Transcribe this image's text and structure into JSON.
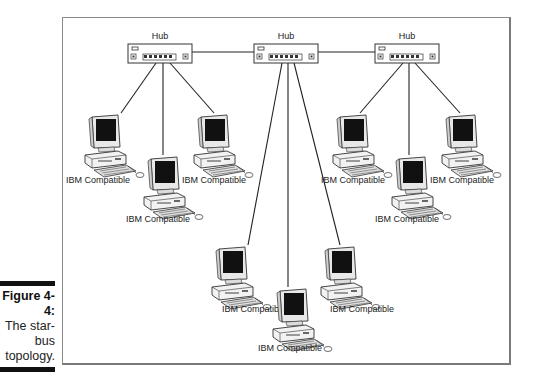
{
  "figure": {
    "number": "Figure 4-4:",
    "caption_lines": [
      "The star-",
      "bus",
      "topology."
    ]
  },
  "hubs": [
    {
      "label": "Hub"
    },
    {
      "label": "Hub"
    },
    {
      "label": "Hub"
    }
  ],
  "computers": [
    {
      "label": "IBM Compatible"
    },
    {
      "label": "IBM Compatible"
    },
    {
      "label": "IBM Compatible"
    },
    {
      "label": "IBM Compatible"
    },
    {
      "label": "IBM Compatible"
    },
    {
      "label": "IBM Compatible"
    },
    {
      "label": "IBM Compatible"
    },
    {
      "label": "IBM Compatible"
    },
    {
      "label": "IBM Compatible"
    }
  ]
}
